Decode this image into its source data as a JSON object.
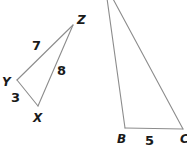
{
  "figure": {
    "type": "geometry-diagram",
    "background_color": "#ffffff",
    "stroke_color": "#8c8c8c",
    "label_color": "#1a1a1a",
    "stroke_width": 1.1,
    "canvas": {
      "width": 187,
      "height": 151
    }
  },
  "triangles": [
    {
      "name": "triangle-xyz",
      "vertices": [
        {
          "id": "Z",
          "label": "Z",
          "x": 73,
          "y": 25,
          "label_x": 77,
          "label_y": 14
        },
        {
          "id": "Y",
          "label": "Y",
          "x": 17,
          "y": 80,
          "label_x": 2,
          "label_y": 76
        },
        {
          "id": "X",
          "label": "X",
          "x": 38,
          "y": 106,
          "label_x": 33,
          "label_y": 112
        }
      ],
      "sides": [
        {
          "from": "Y",
          "to": "Z",
          "label": "7",
          "label_x": 32,
          "label_y": 39
        },
        {
          "from": "X",
          "to": "Z",
          "label": "8",
          "label_x": 57,
          "label_y": 64
        },
        {
          "from": "Y",
          "to": "X",
          "label": "3",
          "label_x": 11,
          "label_y": 91
        }
      ]
    },
    {
      "name": "triangle-abc-cropped",
      "vertices": [
        {
          "id": "A",
          "label": "",
          "x": 105,
          "y": -16,
          "label_x": null,
          "label_y": null
        },
        {
          "id": "B",
          "label": "B",
          "x": 125,
          "y": 128,
          "label_x": 117,
          "label_y": 133
        },
        {
          "id": "C",
          "label": "C",
          "x": 183,
          "y": 129,
          "label_x": 180,
          "label_y": 133
        }
      ],
      "sides": [
        {
          "from": "A",
          "to": "B",
          "label": "",
          "label_x": null,
          "label_y": null
        },
        {
          "from": "A",
          "to": "C",
          "label": "",
          "label_x": null,
          "label_y": null
        },
        {
          "from": "B",
          "to": "C",
          "label": "5",
          "label_x": 145,
          "label_y": 134
        }
      ]
    }
  ],
  "labels": {
    "z": "Z",
    "y": "Y",
    "x": "X",
    "b": "B",
    "c": "C",
    "side_yz": "7",
    "side_xz": "8",
    "side_yx": "3",
    "side_bc": "5"
  }
}
